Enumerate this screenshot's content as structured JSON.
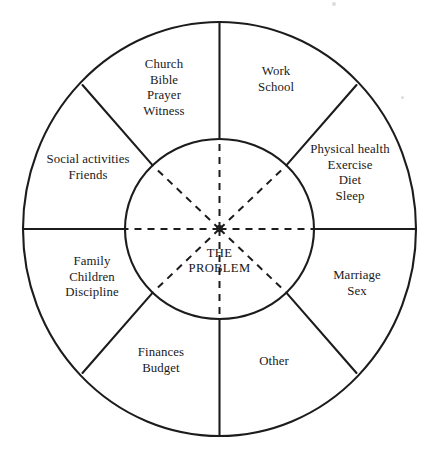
{
  "diagram": {
    "type": "radial-segment-wheel",
    "center": {
      "line1": "THE",
      "line2": "PROBLEM"
    },
    "segments": [
      {
        "id": "work-school",
        "position": "top-right",
        "lines": [
          "Work",
          "School"
        ]
      },
      {
        "id": "physical-health",
        "position": "right-upper",
        "lines": [
          "Physical health",
          "Exercise",
          "Diet",
          "Sleep"
        ]
      },
      {
        "id": "marriage-sex",
        "position": "right-lower",
        "lines": [
          "Marriage",
          "Sex"
        ]
      },
      {
        "id": "other",
        "position": "bottom-right",
        "lines": [
          "Other"
        ]
      },
      {
        "id": "finances-budget",
        "position": "bottom-left",
        "lines": [
          "Finances",
          "Budget"
        ]
      },
      {
        "id": "family-children-discipline",
        "position": "left-lower",
        "lines": [
          "Family",
          "Children",
          "Discipline"
        ]
      },
      {
        "id": "social-activities-friends",
        "position": "left-upper",
        "lines": [
          "Social activities",
          "Friends"
        ]
      },
      {
        "id": "church-bible-prayer-witness",
        "position": "top-left",
        "lines": [
          "Church",
          "Bible",
          "Prayer",
          "Witness"
        ]
      }
    ],
    "colors": {
      "stroke": "#1c1c1c",
      "background": "#ffffff",
      "text": "#1a1a1a"
    },
    "geometry": {
      "center_x": 219.5,
      "center_y": 229,
      "outer_rx": 196.5,
      "outer_ry": 207,
      "inner_rx": 94.5,
      "inner_ry": 90
    }
  }
}
